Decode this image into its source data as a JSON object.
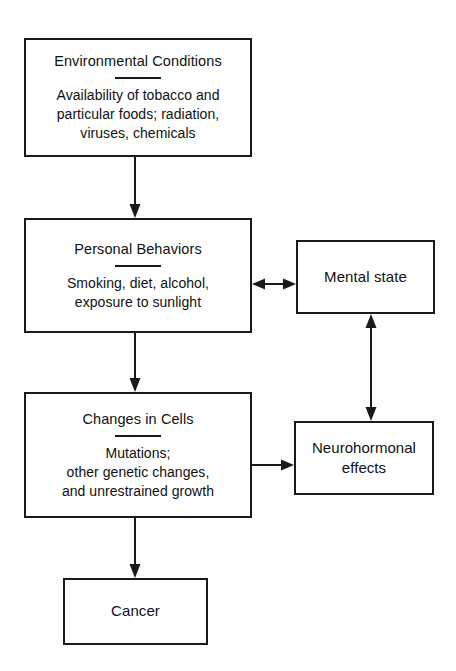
{
  "diagram": {
    "type": "flowchart",
    "orientation": "top-to-bottom",
    "nodes": [
      {
        "id": "environmental",
        "title": "Environmental Conditions",
        "detail": "Availability of tobacco and\nparticular foods; radiation,\nviruses, chemicals",
        "has_divider": true
      },
      {
        "id": "personal",
        "title": "Personal Behaviors",
        "detail": "Smoking, diet, alcohol,\nexposure to sunlight",
        "has_divider": true
      },
      {
        "id": "changes",
        "title": "Changes in Cells",
        "detail": "Mutations;\nother genetic changes,\nand unrestrained growth",
        "has_divider": true
      },
      {
        "id": "cancer",
        "title": "Cancer",
        "detail": "",
        "has_divider": false
      },
      {
        "id": "mental",
        "title": "Mental state",
        "detail": "",
        "has_divider": false
      },
      {
        "id": "neuro",
        "title": "Neurohormonal\neffects",
        "detail": "",
        "has_divider": false
      }
    ],
    "edges": [
      {
        "id": "env-personal",
        "from": "environmental",
        "to": "personal",
        "direction": "down",
        "bidirectional": false
      },
      {
        "id": "pers-changes",
        "from": "personal",
        "to": "changes",
        "direction": "down",
        "bidirectional": false
      },
      {
        "id": "changes-cancer",
        "from": "changes",
        "to": "cancer",
        "direction": "down",
        "bidirectional": false
      },
      {
        "id": "pers-mental",
        "from": "personal",
        "to": "mental",
        "direction": "right",
        "bidirectional": true
      },
      {
        "id": "changes-neuro",
        "from": "changes",
        "to": "neuro",
        "direction": "right",
        "bidirectional": false
      },
      {
        "id": "mental-neuro",
        "from": "neuro",
        "to": "mental",
        "direction": "up",
        "bidirectional": true
      }
    ]
  },
  "colors": {
    "stroke": "#1a1a1a",
    "background": "#fdfdfd",
    "box_fill": "#ffffff",
    "text": "#111111"
  }
}
